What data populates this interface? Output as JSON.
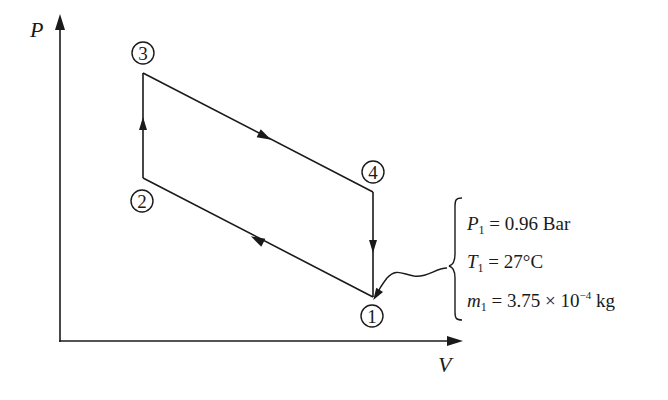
{
  "diagram": {
    "type": "P-V process diagram",
    "axes": {
      "y_label": "P",
      "x_label": "V"
    },
    "states": [
      {
        "id": "1",
        "label": "1"
      },
      {
        "id": "2",
        "label": "2"
      },
      {
        "id": "3",
        "label": "3"
      },
      {
        "id": "4",
        "label": "4"
      }
    ],
    "processes": [
      {
        "from": "1",
        "to": "2",
        "direction": "arrow toward 2 (up-left)"
      },
      {
        "from": "2",
        "to": "3",
        "direction": "arrow up"
      },
      {
        "from": "3",
        "to": "4",
        "direction": "arrow toward 4 (down-right)"
      },
      {
        "from": "4",
        "to": "1",
        "direction": "arrow down"
      }
    ],
    "initial_conditions": {
      "pressure": {
        "symbol": "P",
        "sub": "1",
        "eq": " = 0.96 Bar"
      },
      "temperature": {
        "symbol": "T",
        "sub": "1",
        "eq": " = 27°C"
      },
      "mass": {
        "symbol": "m",
        "sub": "1",
        "eq": " = 3.75 × 10",
        "exp": "−4",
        "unit": " kg"
      }
    }
  }
}
